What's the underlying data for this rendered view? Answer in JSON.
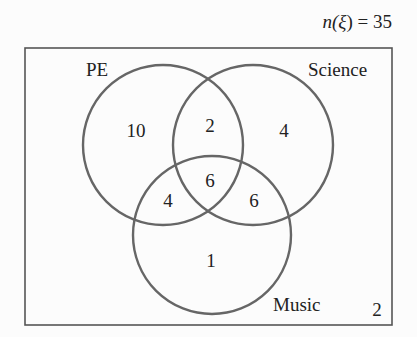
{
  "title": {
    "text": "n(ξ) = 35",
    "prefix": "n(",
    "symbol": "ξ",
    "suffix": ") = 35"
  },
  "sets": [
    {
      "name": "PE",
      "label": "PE"
    },
    {
      "name": "Science",
      "label": "Science"
    },
    {
      "name": "Music",
      "label": "Music"
    }
  ],
  "regions": {
    "pe_only": "10",
    "science_only": "4",
    "music_only": "1",
    "pe_science": "2",
    "pe_music": "4",
    "science_music": "6",
    "all_three": "6",
    "outside": "2"
  },
  "colors": {
    "circle": "#666666",
    "box": "#555555",
    "text": "#222222"
  }
}
